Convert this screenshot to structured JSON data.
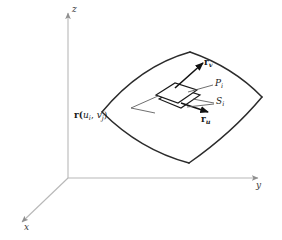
{
  "figure": {
    "background_color": "#ffffff",
    "axis_color": "#b8b8b8",
    "surface_color": "#2b2b2b",
    "patch_color": "#1a1a1a",
    "vector_color": "#111111",
    "leader_color": "#555555"
  },
  "axes": {
    "z_label": "z",
    "y_label": "y",
    "x_label": "x"
  },
  "labels": {
    "tangent_v": "r",
    "tangent_v_sub": "v",
    "tangent_u": "r",
    "tangent_u_sub": "u",
    "patch_p": "P",
    "patch_p_sub": "i",
    "patch_s": "S",
    "patch_s_sub": "i",
    "position_fn": "r(",
    "position_u": "u",
    "position_u_sub": "i",
    "position_sep": ", ",
    "position_v": "v",
    "position_v_sub": "j",
    "position_close": ")"
  }
}
